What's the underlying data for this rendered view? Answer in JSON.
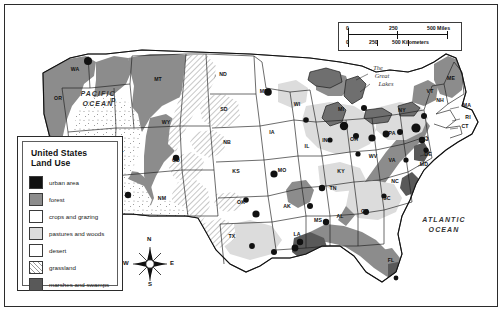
{
  "map": {
    "title": "United States Land Use",
    "ocean_labels": [
      {
        "name": "pacific-ocean",
        "text": "PACIFIC OCEAN",
        "line1": "PACIFIC",
        "line2": "OCEAN"
      },
      {
        "name": "atlantic-ocean",
        "text": "ATLANTIC OCEAN",
        "line1": "ATLANTIC",
        "line2": "OCEAN"
      }
    ],
    "feature_labels": [
      {
        "name": "great-lakes",
        "line1": "The",
        "line2": "Great",
        "line3": "Lakes"
      }
    ],
    "states": [
      {
        "abbr": "WA",
        "x": 65,
        "y": 61
      },
      {
        "abbr": "OR",
        "x": 48,
        "y": 90
      },
      {
        "abbr": "CA",
        "x": 45,
        "y": 152
      },
      {
        "abbr": "NV",
        "x": 73,
        "y": 139
      },
      {
        "abbr": "ID",
        "x": 103,
        "y": 92
      },
      {
        "abbr": "MT",
        "x": 148,
        "y": 71
      },
      {
        "abbr": "WY",
        "x": 156,
        "y": 114
      },
      {
        "abbr": "UT",
        "x": 110,
        "y": 145
      },
      {
        "abbr": "AZ",
        "x": 106,
        "y": 186
      },
      {
        "abbr": "CO",
        "x": 166,
        "y": 152
      },
      {
        "abbr": "NM",
        "x": 152,
        "y": 190
      },
      {
        "abbr": "ND",
        "x": 213,
        "y": 66
      },
      {
        "abbr": "SD",
        "x": 214,
        "y": 101
      },
      {
        "abbr": "NB",
        "x": 217,
        "y": 134
      },
      {
        "abbr": "KS",
        "x": 226,
        "y": 163
      },
      {
        "abbr": "OK",
        "x": 231,
        "y": 194
      },
      {
        "abbr": "TX",
        "x": 222,
        "y": 228
      },
      {
        "abbr": "MN",
        "x": 254,
        "y": 83
      },
      {
        "abbr": "IA",
        "x": 262,
        "y": 124
      },
      {
        "abbr": "MO",
        "x": 272,
        "y": 162
      },
      {
        "abbr": "AK",
        "x": 277,
        "y": 198
      },
      {
        "abbr": "LA",
        "x": 287,
        "y": 226
      },
      {
        "abbr": "MS",
        "x": 308,
        "y": 212
      },
      {
        "abbr": "AL",
        "x": 330,
        "y": 208
      },
      {
        "abbr": "WI",
        "x": 287,
        "y": 96
      },
      {
        "abbr": "IL",
        "x": 297,
        "y": 138
      },
      {
        "abbr": "TN",
        "x": 323,
        "y": 180
      },
      {
        "abbr": "KY",
        "x": 331,
        "y": 163
      },
      {
        "abbr": "IN",
        "x": 315,
        "y": 132
      },
      {
        "abbr": "MI",
        "x": 331,
        "y": 101
      },
      {
        "abbr": "OH",
        "x": 344,
        "y": 131
      },
      {
        "abbr": "GA",
        "x": 355,
        "y": 203
      },
      {
        "abbr": "FL",
        "x": 381,
        "y": 252
      },
      {
        "abbr": "SC",
        "x": 377,
        "y": 190
      },
      {
        "abbr": "NC",
        "x": 385,
        "y": 173
      },
      {
        "abbr": "VA",
        "x": 382,
        "y": 152
      },
      {
        "abbr": "WV",
        "x": 363,
        "y": 148
      },
      {
        "abbr": "PA",
        "x": 382,
        "y": 125
      },
      {
        "abbr": "NY",
        "x": 392,
        "y": 102
      },
      {
        "abbr": "VT",
        "x": 420,
        "y": 83
      },
      {
        "abbr": "NH",
        "x": 430,
        "y": 92
      },
      {
        "abbr": "ME",
        "x": 441,
        "y": 70
      },
      {
        "abbr": "MA",
        "x": 457,
        "y": 97
      },
      {
        "abbr": "RI",
        "x": 458,
        "y": 109
      },
      {
        "abbr": "CT",
        "x": 455,
        "y": 118
      },
      {
        "abbr": "NJ",
        "x": 415,
        "y": 131
      },
      {
        "abbr": "DE",
        "x": 418,
        "y": 146
      },
      {
        "abbr": "MD",
        "x": 414,
        "y": 156
      }
    ]
  },
  "legend": {
    "title_line1": "United States",
    "title_line2": "Land Use",
    "items": [
      {
        "name": "urban-area",
        "label": "urban area",
        "swatch": "sw-urban",
        "color": "#111111"
      },
      {
        "name": "forest",
        "label": "forest",
        "swatch": "sw-forest",
        "color": "#8c8c8c"
      },
      {
        "name": "crops-and-grazing",
        "label": "crops and grazing",
        "swatch": "sw-crops",
        "color": "#ffffff"
      },
      {
        "name": "pastures-and-woods",
        "label": "pastures and woods",
        "swatch": "sw-past",
        "color": "#dcdcdc"
      },
      {
        "name": "desert",
        "label": "desert",
        "swatch": "sw-desert",
        "color": "#ffffff"
      },
      {
        "name": "grassland",
        "label": "grassland",
        "swatch": "sw-grass",
        "color": "#ffffff"
      },
      {
        "name": "marshes-and-swamps",
        "label": "marshes and swamps",
        "swatch": "sw-marsh",
        "color": "#595959"
      }
    ]
  },
  "scale_bar": {
    "miles": {
      "ticks": [
        "0",
        "250",
        "500"
      ],
      "unit": "Miles",
      "label_right": "500 Miles"
    },
    "kilometers": {
      "ticks": [
        "0",
        "250",
        "500"
      ],
      "unit": "Kilometers",
      "label_right": "500 Kilometers"
    },
    "miles_0": "0",
    "miles_250": "250",
    "miles_500": "500 Miles",
    "km_0": "0",
    "km_250": "250",
    "km_500": "500 Kilometers"
  },
  "compass": {
    "n": "N",
    "e": "E",
    "s": "S",
    "w": "W"
  },
  "colors": {
    "urban": "#111111",
    "forest": "#8c8c8c",
    "crops": "#ffffff",
    "pastures": "#dcdcdc",
    "marsh": "#595959",
    "lake": "#6f6f6f",
    "border": "#1d1d1d"
  }
}
